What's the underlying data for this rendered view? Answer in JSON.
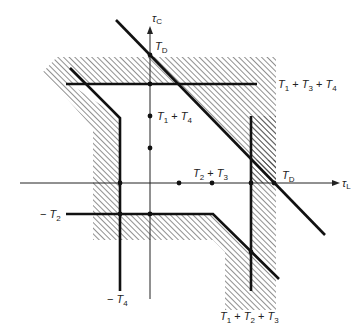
{
  "diagram": {
    "axes": {
      "x_label": "τ",
      "x_sub": "L",
      "y_label": "τ",
      "y_sub": "C"
    },
    "labels": {
      "td_top": {
        "main": "T",
        "sub": "D"
      },
      "td_right": {
        "main": "T",
        "sub": "D"
      },
      "t1_t3_t4": {
        "parts": [
          "T",
          "1",
          " + ",
          "T",
          "3",
          " + ",
          "T",
          "4"
        ]
      },
      "t1_t4": {
        "parts": [
          "T",
          "1",
          " + ",
          "T",
          "4"
        ]
      },
      "t2_t3": {
        "parts": [
          "T",
          "2",
          " + ",
          "T",
          "3"
        ]
      },
      "neg_t2": {
        "prefix": "− ",
        "main": "T",
        "sub": "2"
      },
      "neg_t4": {
        "prefix": "− ",
        "main": "T",
        "sub": "4"
      },
      "t1_t2_t3": {
        "parts": [
          "T",
          "1",
          " + ",
          "T",
          "2",
          " + ",
          "T",
          "3"
        ]
      }
    },
    "colors": {
      "line": "#111111",
      "axis": "#222222",
      "hatch": "#333333",
      "background": "#ffffff"
    }
  }
}
